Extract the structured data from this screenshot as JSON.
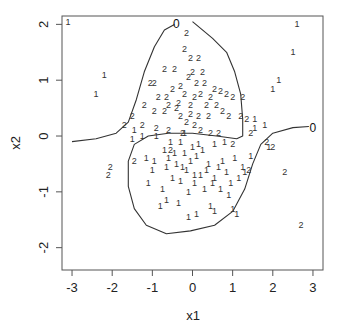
{
  "chart_data": {
    "type": "scatter",
    "title": "",
    "xlabel": "x1",
    "ylabel": "x2",
    "xlim": [
      -3.25,
      3.25
    ],
    "ylim": [
      -2.4,
      2.15
    ],
    "grid": false,
    "legend": "none",
    "xticks": [
      -3,
      -2,
      -1,
      0,
      1,
      2,
      3
    ],
    "xtick_labels": [
      "-3",
      "-2",
      "-1",
      "0",
      "1",
      "2",
      "3"
    ],
    "yticks": [
      -2,
      -1,
      0,
      1,
      2
    ],
    "ytick_labels": [
      "-2",
      "-1",
      "0",
      "1",
      "2"
    ],
    "series": [
      {
        "name": "1",
        "marker_text": "1",
        "points": [
          [
            -3.1,
            2.05
          ],
          [
            -2.2,
            1.1
          ],
          [
            -2.4,
            0.75
          ],
          [
            2.6,
            2.0
          ],
          [
            2.5,
            1.5
          ],
          [
            2.15,
            1.0
          ],
          [
            2.0,
            0.85
          ],
          [
            -1.5,
            -0.05
          ],
          [
            -1.45,
            0.1
          ],
          [
            -0.9,
            0.0
          ],
          [
            -1.15,
            -0.4
          ],
          [
            -1.0,
            -0.6
          ],
          [
            -0.7,
            -0.25
          ],
          [
            -0.55,
            -0.1
          ],
          [
            -0.6,
            -0.4
          ],
          [
            -0.4,
            -0.5
          ],
          [
            -0.5,
            -0.75
          ],
          [
            -0.3,
            -0.8
          ],
          [
            -0.75,
            -0.95
          ],
          [
            -0.65,
            -1.15
          ],
          [
            -0.8,
            -1.25
          ],
          [
            -0.3,
            -0.1
          ],
          [
            -0.2,
            -0.3
          ],
          [
            -0.05,
            -0.45
          ],
          [
            0.1,
            -0.35
          ],
          [
            0.25,
            -0.25
          ],
          [
            0.4,
            -0.5
          ],
          [
            0.2,
            -0.7
          ],
          [
            0.05,
            -0.85
          ],
          [
            -0.1,
            -1.0
          ],
          [
            0.3,
            -0.95
          ],
          [
            0.55,
            -0.75
          ],
          [
            0.75,
            -0.45
          ],
          [
            0.85,
            -0.65
          ],
          [
            1.05,
            -0.4
          ],
          [
            0.7,
            -0.95
          ],
          [
            0.95,
            -0.85
          ],
          [
            -0.1,
            -1.45
          ],
          [
            0.1,
            -1.4
          ],
          [
            0.45,
            -1.25
          ],
          [
            0.55,
            -1.35
          ],
          [
            1.0,
            -1.3
          ],
          [
            1.1,
            -1.4
          ],
          [
            -1.1,
            -0.85
          ],
          [
            -0.95,
            -0.45
          ],
          [
            -0.45,
            -0.3
          ],
          [
            -0.15,
            -0.6
          ],
          [
            0.15,
            -0.15
          ],
          [
            0.55,
            -0.15
          ],
          [
            1.25,
            -0.55
          ],
          [
            1.45,
            -0.35
          ],
          [
            1.55,
            0.3
          ],
          [
            1.55,
            0.15
          ],
          [
            1.8,
            0.2
          ],
          [
            1.9,
            -0.2
          ],
          [
            1.3,
            -0.65
          ],
          [
            0.8,
            -0.1
          ],
          [
            -0.35,
            -1.2
          ],
          [
            0.05,
            -0.7
          ],
          [
            -0.25,
            -0.55
          ],
          [
            0.35,
            -0.6
          ],
          [
            1.15,
            -0.75
          ],
          [
            0.65,
            -0.55
          ],
          [
            -0.65,
            -0.55
          ],
          [
            -1.25,
            0.0
          ],
          [
            -0.2,
            0.05
          ],
          [
            0.5,
            -0.85
          ],
          [
            0.9,
            -1.05
          ],
          [
            0.0,
            -0.2
          ]
        ]
      },
      {
        "name": "2",
        "marker_text": "2",
        "points": [
          [
            -1.7,
            0.2
          ],
          [
            -1.5,
            0.35
          ],
          [
            -1.2,
            0.55
          ],
          [
            -0.95,
            0.45
          ],
          [
            -0.7,
            0.45
          ],
          [
            -0.6,
            0.55
          ],
          [
            -0.4,
            0.5
          ],
          [
            -1.05,
            0.95
          ],
          [
            -0.95,
            0.95
          ],
          [
            -0.7,
            1.2
          ],
          [
            -0.45,
            1.2
          ],
          [
            -0.5,
            0.85
          ],
          [
            -0.3,
            0.9
          ],
          [
            -0.2,
            0.75
          ],
          [
            -0.2,
            1.55
          ],
          [
            -0.15,
            1.85
          ],
          [
            -0.05,
            1.4
          ],
          [
            0.15,
            1.4
          ],
          [
            0.0,
            1.15
          ],
          [
            0.25,
            1.15
          ],
          [
            -0.1,
            1.05
          ],
          [
            0.1,
            0.95
          ],
          [
            0.3,
            0.95
          ],
          [
            -0.35,
            0.6
          ],
          [
            0.05,
            0.7
          ],
          [
            0.2,
            0.75
          ],
          [
            0.45,
            0.7
          ],
          [
            0.7,
            0.8
          ],
          [
            0.85,
            0.75
          ],
          [
            1.0,
            0.7
          ],
          [
            1.25,
            0.7
          ],
          [
            0.6,
            0.55
          ],
          [
            0.75,
            0.45
          ],
          [
            0.9,
            0.35
          ],
          [
            1.2,
            0.35
          ],
          [
            1.35,
            0.3
          ],
          [
            0.4,
            0.35
          ],
          [
            0.15,
            0.35
          ],
          [
            -0.05,
            0.4
          ],
          [
            -0.15,
            0.25
          ],
          [
            0.05,
            0.2
          ],
          [
            -0.9,
            0.15
          ],
          [
            -0.6,
            0.1
          ],
          [
            0.45,
            0.05
          ],
          [
            0.65,
            0.05
          ],
          [
            1.45,
            0.05
          ],
          [
            1.0,
            -0.15
          ],
          [
            2.0,
            -0.2
          ],
          [
            1.85,
            -0.1
          ],
          [
            -1.45,
            -0.45
          ],
          [
            -2.05,
            -0.55
          ],
          [
            -2.1,
            -0.7
          ],
          [
            2.3,
            -0.65
          ],
          [
            2.7,
            -1.6
          ],
          [
            1.4,
            -0.6
          ],
          [
            -0.3,
            0.35
          ],
          [
            0.35,
            0.55
          ],
          [
            -0.65,
            0.7
          ],
          [
            -0.85,
            0.7
          ],
          [
            -1.25,
            0.2
          ],
          [
            0.55,
            0.85
          ],
          [
            -0.05,
            0.55
          ],
          [
            -0.25,
            0.05
          ],
          [
            -0.55,
            -0.25
          ],
          [
            0.2,
            0.1
          ]
        ]
      }
    ],
    "annotations": [
      {
        "text": "0",
        "x": -0.4,
        "y": 2.0
      },
      {
        "text": "0",
        "x": 3.0,
        "y": 0.15
      }
    ],
    "contours": [
      {
        "level": "0",
        "points": [
          [
            -3.0,
            -0.1
          ],
          [
            -2.4,
            -0.05
          ],
          [
            -1.9,
            0.05
          ],
          [
            -1.6,
            0.25
          ],
          [
            -1.4,
            0.65
          ],
          [
            -1.2,
            1.15
          ],
          [
            -0.95,
            1.6
          ],
          [
            -0.7,
            1.9
          ],
          [
            -0.45,
            2.0
          ]
        ]
      },
      {
        "level": "0",
        "points": [
          [
            0.0,
            2.05
          ],
          [
            0.5,
            1.75
          ],
          [
            0.85,
            1.5
          ],
          [
            1.05,
            1.15
          ],
          [
            1.2,
            0.75
          ],
          [
            1.25,
            0.3
          ],
          [
            1.25,
            0.0
          ],
          [
            1.1,
            -0.05
          ],
          [
            0.6,
            0.0
          ],
          [
            0.0,
            0.05
          ],
          [
            -0.6,
            0.05
          ],
          [
            -1.1,
            0.0
          ],
          [
            -1.45,
            -0.15
          ],
          [
            -1.6,
            -0.45
          ],
          [
            -1.6,
            -0.9
          ],
          [
            -1.45,
            -1.3
          ],
          [
            -1.15,
            -1.6
          ],
          [
            -0.65,
            -1.75
          ],
          [
            -0.05,
            -1.7
          ],
          [
            0.55,
            -1.6
          ],
          [
            1.0,
            -1.35
          ],
          [
            1.3,
            -0.95
          ],
          [
            1.5,
            -0.5
          ],
          [
            1.7,
            -0.15
          ],
          [
            2.0,
            0.05
          ],
          [
            2.5,
            0.15
          ],
          [
            2.9,
            0.17
          ]
        ]
      }
    ]
  }
}
